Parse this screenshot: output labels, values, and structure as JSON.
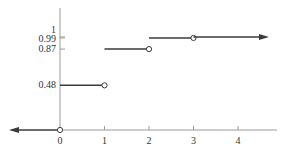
{
  "chart_data": {
    "type": "line",
    "subtype": "step",
    "title": "",
    "xlabel": "",
    "ylabel": "",
    "xlim": [
      -1.1,
      4.9
    ],
    "ylim": [
      0,
      1.05
    ],
    "grid": false,
    "legend": null,
    "x_ticks": [
      {
        "value": 0,
        "label": "0"
      },
      {
        "value": 1,
        "label": "1"
      },
      {
        "value": 2,
        "label": "2"
      },
      {
        "value": 3,
        "label": "3"
      },
      {
        "value": 4,
        "label": "4"
      }
    ],
    "y_ticks": [
      {
        "value": 0.48,
        "label": "0.48"
      },
      {
        "value": 0.87,
        "label": "0.87"
      },
      {
        "value": 0.99,
        "label": "0.99"
      },
      {
        "value": 1,
        "label": "1"
      }
    ],
    "segments": [
      {
        "x_start": null,
        "x_end": 0,
        "y": 0,
        "left_arrow": true,
        "right_open": true
      },
      {
        "x_start": 0,
        "x_end": 1,
        "y": 0.48,
        "right_open": true
      },
      {
        "x_start": 1,
        "x_end": 2,
        "y": 0.87,
        "right_open": true
      },
      {
        "x_start": 2,
        "x_end": 3,
        "y": 0.99,
        "right_open": true
      },
      {
        "x_start": 3,
        "x_end": null,
        "y": 1,
        "right_arrow": true
      }
    ],
    "colors": {
      "axis": "#9a9a9a",
      "step": "#3a3a3a",
      "label": "#333333"
    }
  }
}
